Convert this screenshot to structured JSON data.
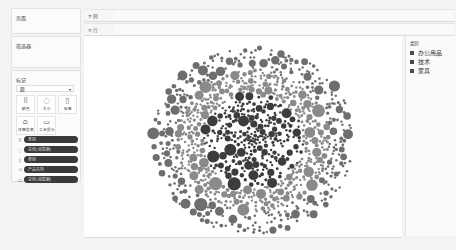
{
  "left_panel": {
    "pages_title": "页面",
    "filters_title": "筛选器",
    "marks": {
      "title": "标记",
      "mark_type": "圆",
      "buttons": [
        {
          "label": "颜色",
          "icon": "color-icon"
        },
        {
          "label": "大小",
          "icon": "size-icon"
        },
        {
          "label": "标签",
          "icon": "label-icon"
        },
        {
          "label": "详细信息",
          "icon": "detail-icon"
        },
        {
          "label": "工具提示",
          "icon": "tooltip-icon"
        }
      ],
      "pills": [
        {
          "role": "color",
          "label": "类别"
        },
        {
          "role": "size",
          "label": "总和(销售额)"
        },
        {
          "role": "label",
          "label": "类别"
        },
        {
          "role": "detail",
          "label": "产品名称"
        },
        {
          "role": "tooltip",
          "label": "总和(销售额)"
        }
      ]
    }
  },
  "shelves": {
    "columns_label": "列",
    "rows_label": "行"
  },
  "legend": {
    "title": "类别",
    "items": [
      {
        "label": "办公用品",
        "color": "#4a4a4a"
      },
      {
        "label": "技术",
        "color": "#4a4a4a"
      },
      {
        "label": "家具",
        "color": "#4a4a4a"
      }
    ]
  },
  "chart_data": {
    "type": "packed-bubble",
    "title": "",
    "color_field": "类别",
    "size_field": "总和(销售额)",
    "detail_field": "产品名称",
    "legend": [
      "办公用品",
      "技术",
      "家具"
    ],
    "series": [
      {
        "name": "技术",
        "ring": "center",
        "color": "#3c3c3c",
        "approx_bubbles": 260
      },
      {
        "name": "办公用品",
        "ring": "middle",
        "color": "#8a8a8a",
        "approx_bubbles": 420
      },
      {
        "name": "家具",
        "ring": "outer",
        "color": "#6e6e6e",
        "approx_bubbles": 320
      }
    ],
    "center": [
      253,
      141
    ],
    "radii": {
      "center": 48,
      "middle": 72,
      "outer": 96
    }
  }
}
